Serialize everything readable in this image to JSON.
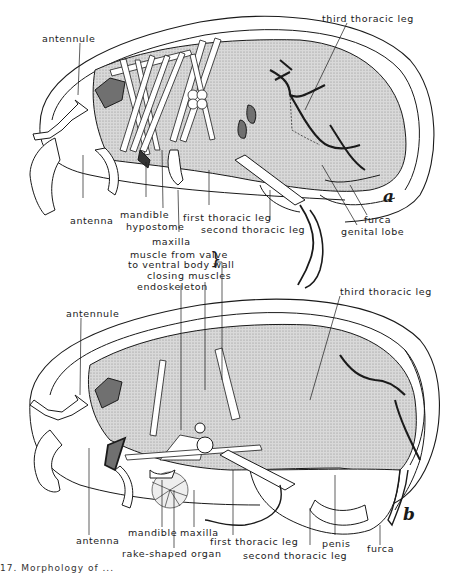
{
  "figure": {
    "panels": [
      {
        "id": "a",
        "letter": "a",
        "labels": {
          "antennule": "antennule",
          "third_thoracic_leg": "third thoracic leg",
          "antenna": "antenna",
          "mandible": "mandible",
          "hypostome": "hypostome",
          "maxilla": "maxilla",
          "first_thoracic_leg": "first thoracic leg",
          "second_thoracic_leg": "second thoracic leg",
          "furca": "furca",
          "genital_lobe": "genital lobe"
        }
      },
      {
        "id": "b",
        "letter": "b",
        "labels": {
          "muscle_valve_line1": "muscle from valve",
          "muscle_valve_line2": "to ventral body wall",
          "closing_muscles": "closing muscles",
          "endoskeleton": "endoskeleton",
          "antennule": "antennule",
          "third_thoracic_leg": "third thoracic leg",
          "antenna": "antenna",
          "mandible": "mandible",
          "maxilla": "maxilla",
          "rake_shaped_organ": "rake-shaped organ",
          "first_thoracic_leg": "first thoracic leg",
          "second_thoracic_leg": "second thoracic leg",
          "penis": "penis",
          "furca": "furca"
        }
      }
    ],
    "caption_fragment": "17. Morphology of ..."
  },
  "colors": {
    "ink": "#1a1a1a",
    "stipple": "#bdbdbd",
    "dark_fill": "#6a6a6a",
    "paper": "#ffffff"
  }
}
